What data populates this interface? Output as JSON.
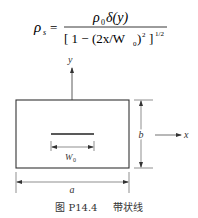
{
  "formula": {
    "lhs_symbol": "ρ",
    "lhs_subscript": "s",
    "equals": "=",
    "numerator": {
      "rho": "ρ",
      "rho_sub": "0",
      "delta": "δ(y)"
    },
    "denominator": {
      "open": "[ 1 − (2x/W",
      "w_sub": "0",
      "close": ")",
      "square": "2",
      "bracket_close": "]",
      "power": "1/2"
    }
  },
  "diagram": {
    "y_axis_label": "y",
    "x_axis_label": "x",
    "width_label": "a",
    "height_label": "b",
    "strip_width_label": "W",
    "strip_width_sub": "0",
    "line_color": "#333333"
  },
  "caption": {
    "figure_number": "图 P14.4",
    "title": "带状线"
  }
}
